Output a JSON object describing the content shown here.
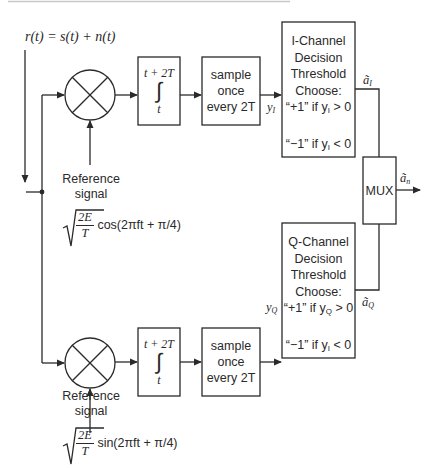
{
  "diagram": {
    "type": "QPSK coherent receiver block diagram",
    "input_signal": "r(t) = s(t) + n(t)",
    "i_branch": {
      "integrator": {
        "upper_limit": "t + 2T",
        "symbol": "∫",
        "lower_limit": "t"
      },
      "sampler": {
        "line1": "sample",
        "line2": "once",
        "line3": "every 2T"
      },
      "sample_output": "y",
      "sample_output_sub": "I",
      "decision": {
        "line1": "I-Channel",
        "line2": "Decision",
        "line3": "Threshold",
        "line4": "Choose:",
        "rule_pos": "“+1” if y",
        "rule_pos_sub": "I",
        "rule_pos_tail": " > 0",
        "rule_neg": "“−1” if y",
        "rule_neg_sub": "I",
        "rule_neg_tail": " < 0"
      },
      "decision_output": "ã",
      "decision_output_sub": "I",
      "reference": {
        "line1": "Reference",
        "line2": "signal",
        "sqrt_num": "2E",
        "sqrt_den": "T",
        "func": "cos(2πft + π/4)"
      }
    },
    "q_branch": {
      "integrator": {
        "upper_limit": "t + 2T",
        "symbol": "∫",
        "lower_limit": "t"
      },
      "sampler": {
        "line1": "sample",
        "line2": "once",
        "line3": "every 2T"
      },
      "sample_output": "y",
      "sample_output_sub": "Q",
      "decision": {
        "line1": "Q-Channel",
        "line2": "Decision",
        "line3": "Threshold",
        "line4": "Choose:",
        "rule_pos": "“+1” if y",
        "rule_pos_sub": "Q",
        "rule_pos_tail": " > 0",
        "rule_neg": "“−1” if y",
        "rule_neg_sub": "I",
        "rule_neg_tail": " < 0"
      },
      "decision_output": "ã",
      "decision_output_sub": "Q",
      "reference": {
        "line1": "Reference",
        "line2": "signal",
        "sqrt_num": "2E",
        "sqrt_den": "T",
        "func": "sin(2πft + π/4)"
      }
    },
    "mux": {
      "label": "MUX",
      "output": "ã",
      "output_sub": "n"
    },
    "colors": {
      "line": "#2a2a2a",
      "background": "#ffffff",
      "top_rule": "#c8c8c8"
    }
  }
}
